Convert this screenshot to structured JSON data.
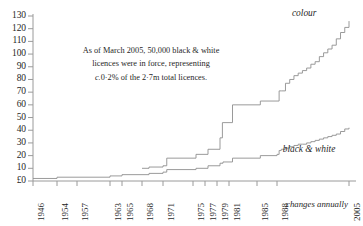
{
  "chart_data": {
    "type": "line",
    "title": "",
    "subtitle": "",
    "xlabel": "",
    "ylabel": "",
    "grid": false,
    "legend_position": "inline-right",
    "step": "post",
    "xlim": [
      1946,
      2005
    ],
    "ylim": [
      0,
      130
    ],
    "y_ticks": [
      0,
      10,
      20,
      30,
      40,
      50,
      60,
      70,
      80,
      90,
      100,
      110,
      120,
      130
    ],
    "y_tick_labels": [
      "£0",
      "10",
      "20",
      "30",
      "40",
      "50",
      "60",
      "70",
      "80",
      "90",
      "100",
      "110",
      "120",
      "130"
    ],
    "x_ticks": [
      1946,
      1954,
      1957,
      1963,
      1965,
      1968,
      1971,
      1975,
      1977,
      1979,
      1981,
      1985,
      1988,
      2005
    ],
    "x_tick_labels": [
      "1946",
      "1954",
      "1957",
      "1963",
      "1965",
      "1968",
      "1971",
      "1975",
      "1977",
      "1979",
      "1981",
      "1985",
      "1988",
      "2005"
    ],
    "x_axis_note": "changes annually",
    "series": [
      {
        "name": "colour",
        "color": "#8f8f8f",
        "label_x": 1992,
        "label_y": 124,
        "points": [
          {
            "x": 1968,
            "y": 10
          },
          {
            "x": 1969,
            "y": 11
          },
          {
            "x": 1971,
            "y": 12
          },
          {
            "x": 1971.5,
            "y": 18
          },
          {
            "x": 1975,
            "y": 18
          },
          {
            "x": 1975.5,
            "y": 21
          },
          {
            "x": 1977,
            "y": 21
          },
          {
            "x": 1977.5,
            "y": 25
          },
          {
            "x": 1979,
            "y": 25
          },
          {
            "x": 1979.5,
            "y": 34
          },
          {
            "x": 1979.9,
            "y": 46
          },
          {
            "x": 1981,
            "y": 46
          },
          {
            "x": 1981.5,
            "y": 60
          },
          {
            "x": 1985,
            "y": 60
          },
          {
            "x": 1985.5,
            "y": 63
          },
          {
            "x": 1988,
            "y": 63
          },
          {
            "x": 1988.5,
            "y": 71
          },
          {
            "x": 1989,
            "y": 71
          },
          {
            "x": 1990,
            "y": 77
          },
          {
            "x": 1991,
            "y": 80
          },
          {
            "x": 1992,
            "y": 83
          },
          {
            "x": 1993,
            "y": 85
          },
          {
            "x": 1994,
            "y": 87
          },
          {
            "x": 1995,
            "y": 89
          },
          {
            "x": 1996,
            "y": 92
          },
          {
            "x": 1997,
            "y": 94
          },
          {
            "x": 1998,
            "y": 98
          },
          {
            "x": 1999,
            "y": 101
          },
          {
            "x": 2000,
            "y": 104
          },
          {
            "x": 2001,
            "y": 107
          },
          {
            "x": 2002,
            "y": 112
          },
          {
            "x": 2003,
            "y": 117
          },
          {
            "x": 2004,
            "y": 121
          },
          {
            "x": 2005,
            "y": 126
          }
        ]
      },
      {
        "name": "black & white",
        "color": "#8f8f8f",
        "label_x": 1991,
        "label_y": 26,
        "points": [
          {
            "x": 1946,
            "y": 2
          },
          {
            "x": 1954,
            "y": 3
          },
          {
            "x": 1957,
            "y": 3
          },
          {
            "x": 1963,
            "y": 4
          },
          {
            "x": 1965,
            "y": 5
          },
          {
            "x": 1968,
            "y": 5
          },
          {
            "x": 1969,
            "y": 6
          },
          {
            "x": 1971,
            "y": 7
          },
          {
            "x": 1971.5,
            "y": 9
          },
          {
            "x": 1975,
            "y": 9
          },
          {
            "x": 1975.5,
            "y": 10
          },
          {
            "x": 1977,
            "y": 10
          },
          {
            "x": 1977.5,
            "y": 12
          },
          {
            "x": 1979,
            "y": 12
          },
          {
            "x": 1979.5,
            "y": 14
          },
          {
            "x": 1980,
            "y": 15
          },
          {
            "x": 1981,
            "y": 15
          },
          {
            "x": 1981.5,
            "y": 18
          },
          {
            "x": 1985,
            "y": 18
          },
          {
            "x": 1985.5,
            "y": 20
          },
          {
            "x": 1988,
            "y": 21
          },
          {
            "x": 1988.5,
            "y": 24
          },
          {
            "x": 1989,
            "y": 25
          },
          {
            "x": 1990,
            "y": 26
          },
          {
            "x": 1991,
            "y": 27
          },
          {
            "x": 1992,
            "y": 28
          },
          {
            "x": 1993,
            "y": 29
          },
          {
            "x": 1994,
            "y": 29
          },
          {
            "x": 1995,
            "y": 30
          },
          {
            "x": 1996,
            "y": 31
          },
          {
            "x": 1997,
            "y": 32
          },
          {
            "x": 1998,
            "y": 33
          },
          {
            "x": 1999,
            "y": 34
          },
          {
            "x": 2000,
            "y": 35
          },
          {
            "x": 2001,
            "y": 36
          },
          {
            "x": 2002,
            "y": 37
          },
          {
            "x": 2003,
            "y": 39
          },
          {
            "x": 2004,
            "y": 41
          },
          {
            "x": 2005,
            "y": 42
          }
        ]
      }
    ],
    "annotation": {
      "line1": "As of March 2005, 50,000 black & white",
      "line2": "licences were in force, representing",
      "line3_italic": "c.",
      "line3_rest": "0·2% of the 2·7m total licences."
    }
  },
  "colors": {
    "axis": "#9a9a9a",
    "line": "#8f8f8f",
    "text": "#1f1f1f"
  }
}
